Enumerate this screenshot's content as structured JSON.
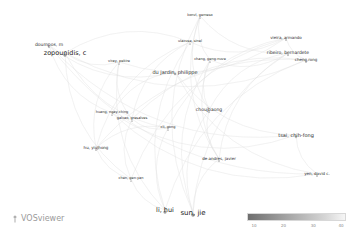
{
  "app": {
    "logo_label": "VOSviewer"
  },
  "chart_data": {
    "type": "network",
    "title": "",
    "nodes": [
      {
        "label": "konvl, gemeso",
        "x": 200,
        "y": 16,
        "size": 3.5
      },
      {
        "label": "ulacuse, sinel",
        "x": 190,
        "y": 42,
        "size": 3.5
      },
      {
        "label": "doumpos, m",
        "x": 49,
        "y": 45,
        "size": 4.5
      },
      {
        "label": "zopounidis, c",
        "x": 65,
        "y": 53,
        "size": 6.5
      },
      {
        "label": "chang, geng-nuve",
        "x": 210,
        "y": 60,
        "size": 3.5
      },
      {
        "label": "viray, pekire",
        "x": 119,
        "y": 62,
        "size": 3.5
      },
      {
        "label": "du jardin, philippe",
        "x": 175,
        "y": 72,
        "size": 5
      },
      {
        "label": "vieira, armando",
        "x": 286,
        "y": 38,
        "size": 4
      },
      {
        "label": "ribeiro, bernardete",
        "x": 288,
        "y": 53,
        "size": 4.5
      },
      {
        "label": "cheng,rong",
        "x": 306,
        "y": 60,
        "size": 4
      },
      {
        "label": "huang, ngay-ching",
        "x": 112,
        "y": 113,
        "size": 3.5
      },
      {
        "label": "galvao, gresalves",
        "x": 132,
        "y": 119,
        "size": 3.5
      },
      {
        "label": "choujbaong",
        "x": 209,
        "y": 110,
        "size": 4.5
      },
      {
        "label": "cli, gong",
        "x": 168,
        "y": 128,
        "size": 3.5
      },
      {
        "label": "tsai, chih-fong",
        "x": 296,
        "y": 135,
        "size": 5
      },
      {
        "label": "hu, yiujhong",
        "x": 96,
        "y": 148,
        "size": 4
      },
      {
        "label": "de andres, javier",
        "x": 219,
        "y": 159,
        "size": 4
      },
      {
        "label": "chen, gen-yan",
        "x": 131,
        "y": 179,
        "size": 3.5
      },
      {
        "label": "yen, david c.",
        "x": 317,
        "y": 174,
        "size": 4
      },
      {
        "label": "li, hui",
        "x": 165,
        "y": 210,
        "size": 6.5
      },
      {
        "label": "sun, jie",
        "x": 193,
        "y": 213,
        "size": 7
      }
    ],
    "legend": {
      "type": "color-scale",
      "min_color": "#6e6e6e",
      "max_color": "#f6f6f6",
      "ticks": [
        "10",
        "20",
        "30",
        "40"
      ]
    }
  }
}
